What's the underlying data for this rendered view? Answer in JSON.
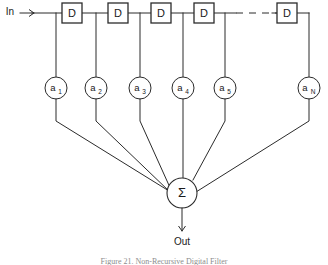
{
  "figure": {
    "input_label": "In",
    "output_label": "Out",
    "sum_symbol": "Σ",
    "caption": "Figure 21.  Non-Recursive Digital Filter",
    "line_color": "#2b2b2b",
    "background_color": "#ffffff"
  },
  "delays": [
    {
      "label": "D",
      "x": 72
    },
    {
      "label": "D",
      "x": 118
    },
    {
      "label": "D",
      "x": 161
    },
    {
      "label": "D",
      "x": 204
    },
    {
      "label": "D",
      "x": 287
    }
  ],
  "ellipsis": {
    "style": "dashed",
    "x_start": 236,
    "x_end": 274
  },
  "taps": [
    {
      "base": "a",
      "subscript": "1",
      "x": 56
    },
    {
      "base": "a",
      "subscript": "2",
      "x": 96
    },
    {
      "base": "a",
      "subscript": "3",
      "x": 140
    },
    {
      "base": "a",
      "subscript": "4",
      "x": 183
    },
    {
      "base": "a",
      "subscript": "5",
      "x": 225
    },
    {
      "base": "a",
      "subscript": "N",
      "x": 309
    }
  ],
  "summer": {
    "cx": 182,
    "cy": 193,
    "r": 15
  }
}
